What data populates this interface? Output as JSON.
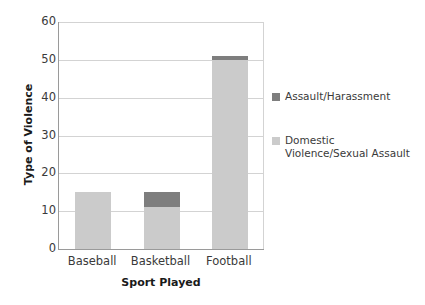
{
  "chart_data": {
    "type": "bar",
    "subtype": "stacked-bar",
    "title": "",
    "subtitle": "",
    "xlabel": "Sport Played",
    "ylabel": "Type of Violence",
    "categories": [
      "Baseball",
      "Basketball",
      "Football"
    ],
    "series": [
      {
        "name": "Domestic Violence/Sexual Assault",
        "legend_label": "Domestic\nViolence/Sexual Assault",
        "color": "#cbcbcb",
        "values": [
          15,
          11,
          50
        ]
      },
      {
        "name": "Assault/Harassment",
        "legend_label": "Assault/Harassment",
        "color": "#7e7e7e",
        "values": [
          0,
          4,
          1
        ]
      }
    ],
    "totals": [
      15,
      15,
      51
    ],
    "ylim": [
      0,
      60
    ],
    "ytick_values": [
      0,
      10,
      20,
      30,
      40,
      50,
      60
    ],
    "ytick_labels": [
      "0",
      "10",
      "20",
      "30",
      "40",
      "50",
      "60"
    ],
    "grid": true,
    "grid_axis": "y",
    "legend_position": "right",
    "legend_entry_order": [
      "Assault/Harassment",
      "Domestic Violence/Sexual Assault"
    ],
    "annotations": []
  },
  "axes": {
    "y_title": "Type of Violence",
    "x_title": "Sport Played",
    "y_ticks": [
      "0",
      "10",
      "20",
      "30",
      "40",
      "50",
      "60"
    ],
    "x_ticks": [
      "Baseball",
      "Basketball",
      "Football"
    ]
  },
  "legend": {
    "entries": [
      {
        "label": "Assault/Harassment",
        "color": "#7e7e7e"
      },
      {
        "label": "Domestic\nViolence/Sexual Assault",
        "color": "#cbcbcb"
      }
    ]
  },
  "colors": {
    "assault_harassment": "#7e7e7e",
    "domestic_violence": "#cbcbcb",
    "gridline": "#d3d3d3",
    "axis_line": "#9a9a9a",
    "tick_text": "#3a3a3a",
    "title_text": "#1a1a1a",
    "background": "#ffffff"
  }
}
